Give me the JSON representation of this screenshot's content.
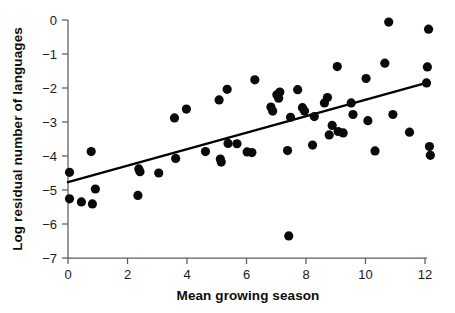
{
  "chart_data": {
    "type": "scatter",
    "title": "",
    "xlabel": "Mean growing season",
    "ylabel": "Log residual number of languages",
    "xlim": [
      0,
      12.4
    ],
    "ylim": [
      -7,
      0
    ],
    "grid": false,
    "legend": null,
    "xticks": [
      0,
      2,
      4,
      6,
      8,
      10,
      12
    ],
    "xtick_labels": [
      "0",
      "2",
      "4",
      "6",
      "8",
      "10",
      "12"
    ],
    "yticks": [
      0,
      -1,
      -2,
      -3,
      -4,
      -5,
      -6,
      -7
    ],
    "ytick_labels": [
      "0",
      "−1",
      "−2",
      "−3",
      "−4",
      "−5",
      "−6",
      "−7"
    ],
    "marker": {
      "shape": "circle",
      "color": "#0a0a0a",
      "size_px": 5.2
    },
    "points": [
      {
        "x": 0.05,
        "y": -4.48
      },
      {
        "x": 0.05,
        "y": -5.26
      },
      {
        "x": 0.45,
        "y": -5.35
      },
      {
        "x": 0.78,
        "y": -3.87
      },
      {
        "x": 0.82,
        "y": -5.41
      },
      {
        "x": 0.92,
        "y": -4.97
      },
      {
        "x": 2.35,
        "y": -5.16
      },
      {
        "x": 2.38,
        "y": -4.38
      },
      {
        "x": 2.42,
        "y": -4.46
      },
      {
        "x": 3.05,
        "y": -4.5
      },
      {
        "x": 3.58,
        "y": -2.88
      },
      {
        "x": 3.62,
        "y": -4.07
      },
      {
        "x": 3.98,
        "y": -2.62
      },
      {
        "x": 4.62,
        "y": -3.87
      },
      {
        "x": 5.08,
        "y": -2.35
      },
      {
        "x": 5.12,
        "y": -4.09
      },
      {
        "x": 5.15,
        "y": -4.18
      },
      {
        "x": 5.35,
        "y": -2.04
      },
      {
        "x": 5.38,
        "y": -3.63
      },
      {
        "x": 5.68,
        "y": -3.64
      },
      {
        "x": 6.02,
        "y": -3.88
      },
      {
        "x": 6.18,
        "y": -3.9
      },
      {
        "x": 6.28,
        "y": -1.76
      },
      {
        "x": 6.82,
        "y": -2.56
      },
      {
        "x": 6.88,
        "y": -2.68
      },
      {
        "x": 7.02,
        "y": -2.2
      },
      {
        "x": 7.08,
        "y": -2.3
      },
      {
        "x": 7.12,
        "y": -2.12
      },
      {
        "x": 7.38,
        "y": -3.84
      },
      {
        "x": 7.42,
        "y": -6.35
      },
      {
        "x": 7.48,
        "y": -2.86
      },
      {
        "x": 7.72,
        "y": -2.05
      },
      {
        "x": 7.88,
        "y": -2.58
      },
      {
        "x": 7.95,
        "y": -2.68
      },
      {
        "x": 8.22,
        "y": -3.68
      },
      {
        "x": 8.28,
        "y": -2.84
      },
      {
        "x": 8.62,
        "y": -2.44
      },
      {
        "x": 8.72,
        "y": -2.28
      },
      {
        "x": 8.78,
        "y": -3.38
      },
      {
        "x": 8.88,
        "y": -3.1
      },
      {
        "x": 9.05,
        "y": -1.37
      },
      {
        "x": 9.08,
        "y": -3.28
      },
      {
        "x": 9.25,
        "y": -3.32
      },
      {
        "x": 9.52,
        "y": -2.44
      },
      {
        "x": 9.58,
        "y": -2.78
      },
      {
        "x": 10.02,
        "y": -1.72
      },
      {
        "x": 10.08,
        "y": -2.96
      },
      {
        "x": 10.32,
        "y": -3.85
      },
      {
        "x": 10.65,
        "y": -1.27
      },
      {
        "x": 10.78,
        "y": -0.06
      },
      {
        "x": 10.92,
        "y": -2.78
      },
      {
        "x": 11.48,
        "y": -3.3
      },
      {
        "x": 12.05,
        "y": -1.85
      },
      {
        "x": 12.08,
        "y": -1.38
      },
      {
        "x": 12.12,
        "y": -0.27
      },
      {
        "x": 12.15,
        "y": -3.72
      },
      {
        "x": 12.18,
        "y": -3.98
      }
    ],
    "fit_line": {
      "type": "linear-regression",
      "x_start": 0.0,
      "y_start": -4.77,
      "x_end": 12.05,
      "y_end": -1.85
    }
  }
}
